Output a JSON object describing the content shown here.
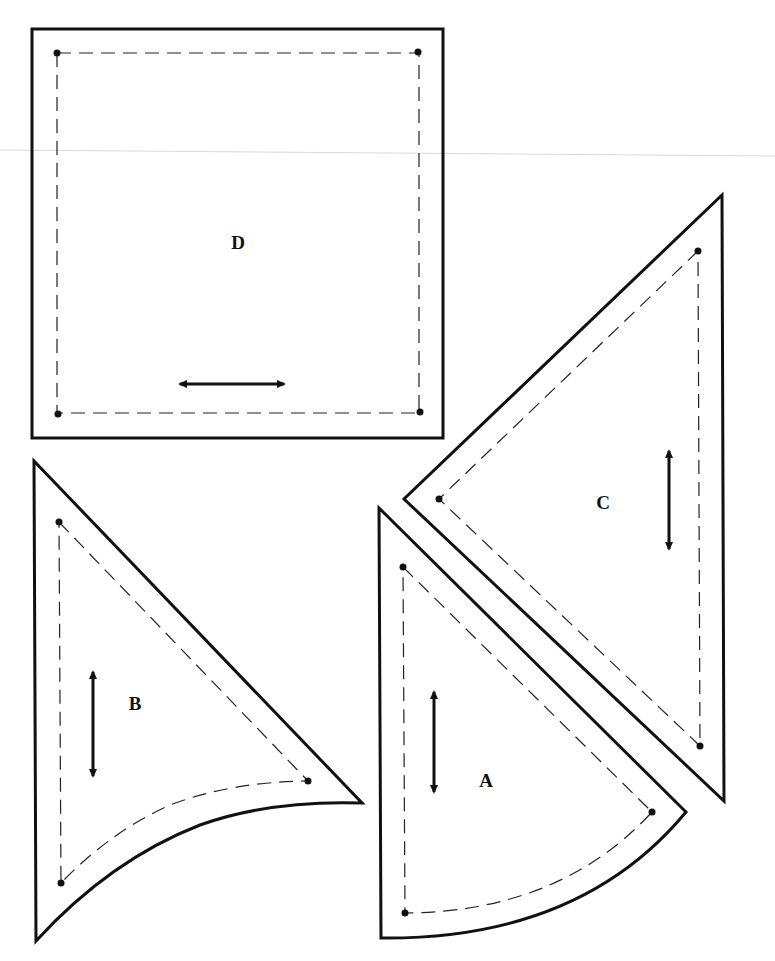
{
  "pieces": [
    {
      "label": "D",
      "shape": "square",
      "grainline": "horizontal"
    },
    {
      "label": "C",
      "shape": "right-triangle",
      "grainline": "vertical"
    },
    {
      "label": "B",
      "shape": "curved-triangle",
      "grainline": "vertical"
    },
    {
      "label": "A",
      "shape": "curved-triangle",
      "grainline": "vertical"
    }
  ],
  "colors": {
    "line": "#111111",
    "background": "#ffffff"
  }
}
